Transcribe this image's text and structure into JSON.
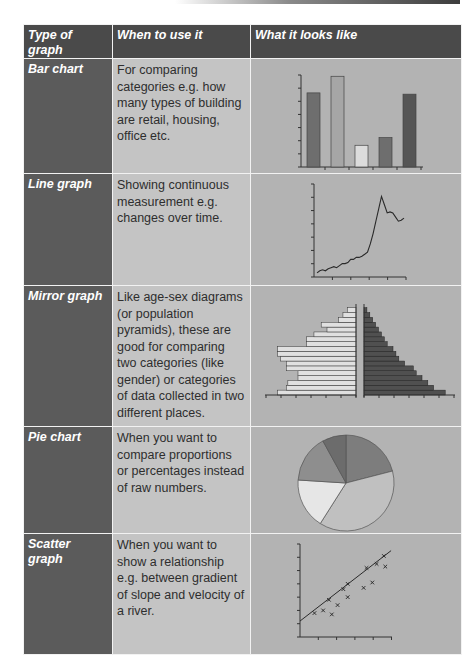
{
  "table": {
    "headers": [
      "Type of graph",
      "When to use it",
      "What it looks like"
    ],
    "rows": [
      {
        "type": "Bar chart",
        "when": "For comparing categories e.g. how many types of building are retail, housing, office etc.",
        "visual": "bar-chart-illustration"
      },
      {
        "type": "Line graph",
        "when": "Showing continuous measurement e.g. changes over time.",
        "visual": "line-graph-illustration"
      },
      {
        "type": "Mirror graph",
        "when": "Like age-sex diagrams (or population pyramids), these are good for comparing two categories (like gender) or categories of data collected in two different places.",
        "visual": "mirror-graph-illustration"
      },
      {
        "type": "Pie chart",
        "when": "When you want to compare proportions or percentages instead of raw numbers.",
        "visual": "pie-chart-illustration"
      },
      {
        "type": "Scatter graph",
        "when": "When you want to show a relationship e.g. between gradient of slope and velocity of a river.",
        "visual": "scatter-graph-illustration"
      }
    ]
  },
  "colors": {
    "header_bg": "#4a4a4a",
    "type_col_bg": "#5b5b5b",
    "when_col_bg": "#c4c4c4",
    "look_col_bg": "#b3b3b3"
  },
  "chart_data": [
    {
      "type": "bar",
      "title": "",
      "categories": [
        "1",
        "2",
        "3",
        "4",
        "5"
      ],
      "values": [
        58,
        71,
        17,
        23,
        57
      ],
      "fills": [
        "#6e6e6e",
        "#a6a6a6",
        "#dcdcdc",
        "#6e6e6e",
        "#555555"
      ],
      "ylim": [
        0,
        72
      ],
      "grid": false
    },
    {
      "type": "line",
      "title": "",
      "x": [
        0,
        1,
        2,
        3,
        4,
        5,
        6,
        7,
        8,
        9,
        10,
        11,
        12,
        13,
        14,
        15,
        16,
        17,
        18,
        19,
        20,
        21,
        22,
        23,
        24,
        25,
        26,
        27,
        28,
        29,
        30,
        31,
        32,
        33,
        34,
        35,
        36,
        37,
        38,
        39,
        40,
        41,
        42,
        43,
        44,
        45,
        46,
        47,
        48
      ],
      "values": [
        4,
        6,
        7,
        6,
        8,
        9,
        10,
        9,
        11,
        13,
        13,
        14,
        17,
        17,
        19,
        19,
        20,
        22,
        24,
        32,
        42,
        54,
        66,
        78,
        70,
        62,
        63,
        62,
        58,
        54,
        55,
        57,
        57,
        56,
        62,
        60,
        58,
        57,
        57,
        57,
        57,
        57,
        57,
        57,
        57,
        57,
        57,
        57,
        57
      ],
      "ylim": [
        0,
        90
      ],
      "grid": false
    },
    {
      "type": "bar",
      "orientation": "horizontal-mirror",
      "title": "",
      "categories": [
        "b1",
        "b2",
        "b3",
        "b4",
        "b5",
        "b6",
        "b7",
        "b8",
        "b9",
        "b10",
        "b11",
        "b12",
        "b13",
        "b14",
        "b15",
        "b16",
        "b17",
        "b18"
      ],
      "series": [
        {
          "name": "left",
          "fill": "#e0e0e0",
          "values": [
            54,
            48,
            47,
            40,
            40,
            48,
            48,
            52,
            54,
            54,
            34,
            34,
            29,
            20,
            24,
            12,
            9,
            6
          ]
        },
        {
          "name": "right",
          "fill": "#505050",
          "values": [
            56,
            48,
            44,
            40,
            36,
            34,
            28,
            24,
            22,
            20,
            16,
            14,
            12,
            10,
            8,
            6,
            4,
            2
          ]
        }
      ],
      "grid": false
    },
    {
      "type": "pie",
      "title": "",
      "labels": [
        "s1",
        "s2",
        "s3",
        "s4",
        "s5"
      ],
      "values": [
        21,
        38,
        17,
        16,
        8
      ],
      "fills": [
        "#7d7d7d",
        "#c0c0c0",
        "#e6e6e6",
        "#8e8e8e",
        "#6c6c6c"
      ]
    },
    {
      "type": "scatter",
      "title": "",
      "x": [
        1.0,
        1.6,
        2.0,
        2.2,
        2.6,
        3.0,
        3.3,
        3.3,
        4.4,
        4.6,
        5.0,
        5.3,
        5.8,
        5.9
      ],
      "y": [
        1.8,
        2.0,
        2.8,
        1.7,
        2.4,
        3.6,
        3.0,
        4.0,
        3.7,
        5.2,
        4.1,
        5.5,
        6.1,
        5.3
      ],
      "trendline": {
        "x": [
          0,
          6.3
        ],
        "y": [
          1.2,
          6.5
        ]
      },
      "xlim": [
        0,
        7
      ],
      "ylim": [
        0,
        7
      ],
      "grid": false
    }
  ]
}
